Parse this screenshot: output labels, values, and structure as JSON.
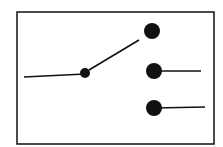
{
  "diagram": {
    "type": "single-pole triple-throw switch",
    "colors": {
      "ink": "#111111",
      "background": "#ffffff"
    },
    "frame": {
      "x": 17,
      "y": 12,
      "w": 197,
      "h": 132
    },
    "input_line": {
      "x1": 24,
      "y1": 77,
      "x2": 85,
      "y2": 74
    },
    "pivot": {
      "cx": 85,
      "cy": 73,
      "r": 5
    },
    "lever": {
      "x1": 89,
      "y1": 70,
      "x2": 139,
      "y2": 40
    },
    "terminals": [
      {
        "cx": 152,
        "cy": 31,
        "r": 8,
        "lead": null
      },
      {
        "cx": 154,
        "cy": 71,
        "r": 8,
        "lead": {
          "x2": 201,
          "y2": 71
        }
      },
      {
        "cx": 154,
        "cy": 108,
        "r": 8,
        "lead": {
          "x2": 205,
          "y2": 107
        }
      }
    ]
  }
}
